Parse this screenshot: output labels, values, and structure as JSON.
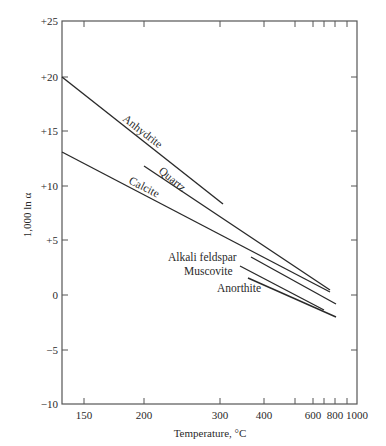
{
  "chart_data": {
    "type": "line",
    "title": "",
    "xlabel": "Temperature, °C",
    "ylabel": "1,000 ln α",
    "x_scale": "1/T² (Kelvin), labeled in °C",
    "xlim": [
      106,
      1000
    ],
    "ylim": [
      -10,
      25
    ],
    "grid": false,
    "legend": "inline labels",
    "x_ticks": [
      {
        "label": "150",
        "value": 150,
        "px": 84
      },
      {
        "label": "200",
        "value": 200,
        "px": 144
      },
      {
        "label": "300",
        "value": 300,
        "px": 220
      },
      {
        "label": "400",
        "value": 400,
        "px": 264
      },
      {
        "label": "",
        "value": 500,
        "px": 295
      },
      {
        "label": "600",
        "value": 600,
        "px": 313
      },
      {
        "label": "",
        "value": 700,
        "px": 324
      },
      {
        "label": "800",
        "value": 800,
        "px": 335
      },
      {
        "label": "",
        "value": 900,
        "px": 347
      },
      {
        "label": "1000",
        "value": 1000,
        "px": 357
      }
    ],
    "y_ticks": [
      {
        "label": "+25",
        "value": 25,
        "py": 21
      },
      {
        "label": "+20",
        "value": 20,
        "py": 77
      },
      {
        "label": "+15",
        "value": 15,
        "py": 131
      },
      {
        "label": "+10",
        "value": 10,
        "py": 186
      },
      {
        "label": "+5",
        "value": 5,
        "py": 240
      },
      {
        "label": "0",
        "value": 0,
        "py": 295
      },
      {
        "label": "−5",
        "value": -5,
        "py": 350
      },
      {
        "label": "−10",
        "value": -10,
        "py": 404
      }
    ],
    "series": [
      {
        "name": "Anhydrite",
        "points": [
          {
            "t": 106,
            "y": 20.0
          },
          {
            "t": 300,
            "y": 8.4
          }
        ],
        "px": [
          [
            62,
            77
          ],
          [
            223,
            204
          ]
        ],
        "label": {
          "x": 122,
          "y": 120,
          "rotate": 38
        }
      },
      {
        "name": "Quartz",
        "points": [
          {
            "t": 200,
            "y": 11.8
          },
          {
            "t": 700,
            "y": 0.5
          }
        ],
        "px": [
          [
            144,
            166
          ],
          [
            330,
            290
          ]
        ],
        "label": {
          "x": 158,
          "y": 172,
          "rotate": 40
        }
      },
      {
        "name": "Calcite",
        "points": [
          {
            "t": 106,
            "y": 13.1
          },
          {
            "t": 700,
            "y": 0.3
          }
        ],
        "px": [
          [
            62,
            152
          ],
          [
            330,
            292
          ]
        ],
        "label": {
          "x": 128,
          "y": 183,
          "rotate": 27
        }
      },
      {
        "name": "Alkali feldspar",
        "points": [
          {
            "t": 370,
            "y": 3.5
          },
          {
            "t": 800,
            "y": -0.8
          }
        ],
        "px": [
          [
            251,
            257
          ],
          [
            336,
            304
          ]
        ],
        "label": {
          "x": 168,
          "y": 261,
          "rotate": 0
        }
      },
      {
        "name": "Muscovite",
        "points": [
          {
            "t": 350,
            "y": 2.7
          },
          {
            "t": 750,
            "y": -1.4
          }
        ],
        "px": [
          [
            240,
            266
          ],
          [
            324,
            310
          ]
        ],
        "label": {
          "x": 184,
          "y": 275,
          "rotate": 0
        }
      },
      {
        "name": "Anorthite",
        "points": [
          {
            "t": 360,
            "y": 1.6
          },
          {
            "t": 800,
            "y": -2.0
          }
        ],
        "px": [
          [
            248,
            278
          ],
          [
            336,
            317
          ]
        ],
        "label": {
          "x": 217,
          "y": 292,
          "rotate": 0
        }
      }
    ]
  },
  "axes": {
    "x_title": "Temperature, °C",
    "y_title": "1,000 ln α"
  },
  "colors": {
    "ink": "#2a2a2a",
    "frame": "#555555",
    "background": "#ffffff"
  }
}
